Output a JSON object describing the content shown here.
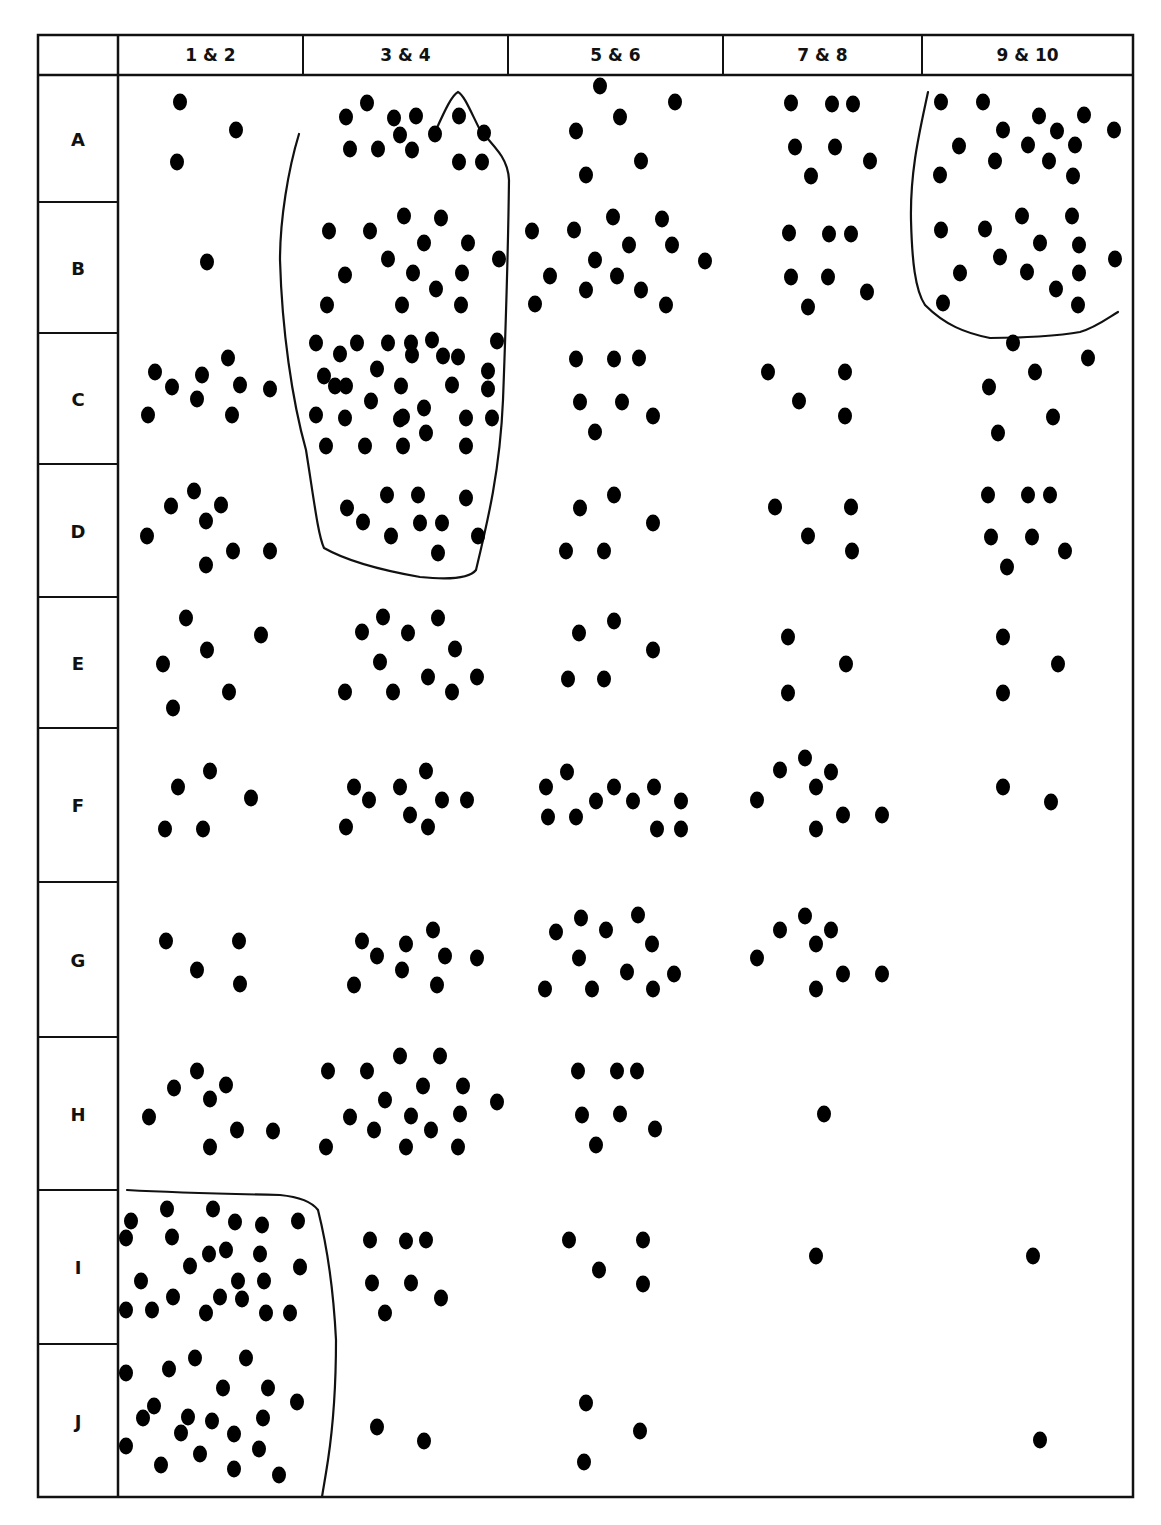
{
  "table": {
    "frame": {
      "left": 38,
      "top": 35,
      "right": 1133,
      "bottom": 1497,
      "header_bottom": 75,
      "label_col_right": 118
    },
    "line_color": "#111111",
    "dot_color": "#000000",
    "columns": [
      {
        "label": "1 & 2",
        "x0": 118,
        "x1": 303
      },
      {
        "label": "3 & 4",
        "x0": 303,
        "x1": 508
      },
      {
        "label": "5 & 6",
        "x0": 508,
        "x1": 723
      },
      {
        "label": "7 & 8",
        "x0": 723,
        "x1": 922
      },
      {
        "label": "9 & 10",
        "x0": 922,
        "x1": 1133
      }
    ],
    "rows": [
      {
        "label": "A",
        "y0": 75,
        "y1": 202
      },
      {
        "label": "B",
        "y0": 202,
        "y1": 333
      },
      {
        "label": "C",
        "y0": 333,
        "y1": 464
      },
      {
        "label": "D",
        "y0": 464,
        "y1": 597
      },
      {
        "label": "E",
        "y0": 597,
        "y1": 728
      },
      {
        "label": "F",
        "y0": 728,
        "y1": 882
      },
      {
        "label": "G",
        "y0": 882,
        "y1": 1037
      },
      {
        "label": "H",
        "y0": 1037,
        "y1": 1190
      },
      {
        "label": "I",
        "y0": 1190,
        "y1": 1344
      },
      {
        "label": "J",
        "y0": 1344,
        "y1": 1497
      }
    ]
  },
  "boundaries": [
    {
      "name": "cluster-3-4-A-D",
      "path": "M299,134 C288,170 280,220 280,260 C282,330 292,400 306,450 C314,500 318,535 324,548 C345,560 380,570 420,577 C450,580 470,578 476,570 C488,520 500,470 503,400 C506,320 508,260 509,180 C508,160 498,150 480,130 C470,110 464,95 458,92 C452,95 445,110 436,130"
    },
    {
      "name": "cluster-9-10-A-B",
      "path": "M928,92 C920,130 910,170 911,220 C912,260 915,290 925,305 C945,325 965,333 990,338 C1020,338 1060,336 1080,332 C1095,328 1108,318 1118,312"
    },
    {
      "name": "cluster-1-2-I-J",
      "path": "M127,1190 C180,1193 230,1194 280,1195 C300,1197 312,1202 318,1210 C328,1250 334,1300 336,1340 C336,1380 334,1420 328,1460 C325,1480 323,1490 322,1497"
    }
  ],
  "dots": [
    [
      180,
      102
    ],
    [
      236,
      130
    ],
    [
      177,
      162
    ],
    [
      367,
      103
    ],
    [
      346,
      117
    ],
    [
      394,
      118
    ],
    [
      416,
      116
    ],
    [
      459,
      116
    ],
    [
      484,
      133
    ],
    [
      435,
      134
    ],
    [
      350,
      149
    ],
    [
      378,
      149
    ],
    [
      400,
      135
    ],
    [
      412,
      150
    ],
    [
      459,
      162
    ],
    [
      482,
      162
    ],
    [
      600,
      86
    ],
    [
      675,
      102
    ],
    [
      620,
      117
    ],
    [
      576,
      131
    ],
    [
      641,
      161
    ],
    [
      586,
      175
    ],
    [
      791,
      103
    ],
    [
      832,
      104
    ],
    [
      853,
      104
    ],
    [
      795,
      147
    ],
    [
      835,
      147
    ],
    [
      870,
      161
    ],
    [
      811,
      176
    ],
    [
      941,
      102
    ],
    [
      983,
      102
    ],
    [
      1039,
      116
    ],
    [
      1084,
      115
    ],
    [
      1114,
      130
    ],
    [
      1003,
      130
    ],
    [
      1057,
      131
    ],
    [
      959,
      146
    ],
    [
      995,
      161
    ],
    [
      1028,
      145
    ],
    [
      1075,
      145
    ],
    [
      1049,
      161
    ],
    [
      940,
      175
    ],
    [
      1073,
      176
    ],
    [
      207,
      262
    ],
    [
      329,
      231
    ],
    [
      370,
      231
    ],
    [
      404,
      216
    ],
    [
      441,
      218
    ],
    [
      424,
      243
    ],
    [
      468,
      243
    ],
    [
      499,
      259
    ],
    [
      345,
      275
    ],
    [
      388,
      259
    ],
    [
      413,
      273
    ],
    [
      436,
      289
    ],
    [
      462,
      273
    ],
    [
      327,
      305
    ],
    [
      402,
      305
    ],
    [
      461,
      305
    ],
    [
      532,
      231
    ],
    [
      574,
      230
    ],
    [
      613,
      217
    ],
    [
      662,
      219
    ],
    [
      629,
      245
    ],
    [
      672,
      245
    ],
    [
      705,
      261
    ],
    [
      550,
      276
    ],
    [
      595,
      260
    ],
    [
      617,
      276
    ],
    [
      641,
      290
    ],
    [
      666,
      305
    ],
    [
      535,
      304
    ],
    [
      586,
      290
    ],
    [
      789,
      233
    ],
    [
      829,
      234
    ],
    [
      851,
      234
    ],
    [
      791,
      277
    ],
    [
      828,
      277
    ],
    [
      867,
      292
    ],
    [
      808,
      307
    ],
    [
      941,
      230
    ],
    [
      985,
      229
    ],
    [
      1022,
      216
    ],
    [
      1072,
      216
    ],
    [
      1040,
      243
    ],
    [
      1079,
      245
    ],
    [
      1115,
      259
    ],
    [
      960,
      273
    ],
    [
      1000,
      257
    ],
    [
      1027,
      272
    ],
    [
      1056,
      289
    ],
    [
      1079,
      273
    ],
    [
      943,
      303
    ],
    [
      1078,
      305
    ],
    [
      155,
      372
    ],
    [
      172,
      387
    ],
    [
      202,
      375
    ],
    [
      228,
      358
    ],
    [
      240,
      385
    ],
    [
      270,
      389
    ],
    [
      148,
      415
    ],
    [
      197,
      399
    ],
    [
      232,
      415
    ],
    [
      316,
      343
    ],
    [
      340,
      354
    ],
    [
      357,
      343
    ],
    [
      388,
      343
    ],
    [
      411,
      343
    ],
    [
      432,
      340
    ],
    [
      458,
      357
    ],
    [
      497,
      341
    ],
    [
      324,
      376
    ],
    [
      346,
      386
    ],
    [
      377,
      369
    ],
    [
      412,
      355
    ],
    [
      443,
      356
    ],
    [
      488,
      371
    ],
    [
      335,
      386
    ],
    [
      401,
      386
    ],
    [
      452,
      385
    ],
    [
      488,
      389
    ],
    [
      316,
      415
    ],
    [
      345,
      418
    ],
    [
      371,
      401
    ],
    [
      400,
      419
    ],
    [
      424,
      408
    ],
    [
      403,
      417
    ],
    [
      466,
      418
    ],
    [
      492,
      418
    ],
    [
      326,
      446
    ],
    [
      365,
      446
    ],
    [
      403,
      446
    ],
    [
      426,
      433
    ],
    [
      466,
      446
    ],
    [
      576,
      359
    ],
    [
      614,
      359
    ],
    [
      639,
      358
    ],
    [
      580,
      402
    ],
    [
      622,
      402
    ],
    [
      653,
      416
    ],
    [
      595,
      432
    ],
    [
      768,
      372
    ],
    [
      845,
      372
    ],
    [
      799,
      401
    ],
    [
      845,
      416
    ],
    [
      1013,
      343
    ],
    [
      1088,
      358
    ],
    [
      1035,
      372
    ],
    [
      989,
      387
    ],
    [
      1053,
      417
    ],
    [
      998,
      433
    ],
    [
      171,
      506
    ],
    [
      194,
      491
    ],
    [
      206,
      521
    ],
    [
      221,
      505
    ],
    [
      147,
      536
    ],
    [
      233,
      551
    ],
    [
      270,
      551
    ],
    [
      206,
      565
    ],
    [
      347,
      508
    ],
    [
      387,
      495
    ],
    [
      418,
      495
    ],
    [
      466,
      498
    ],
    [
      363,
      522
    ],
    [
      420,
      523
    ],
    [
      442,
      523
    ],
    [
      391,
      536
    ],
    [
      478,
      536
    ],
    [
      438,
      553
    ],
    [
      580,
      508
    ],
    [
      614,
      495
    ],
    [
      653,
      523
    ],
    [
      566,
      551
    ],
    [
      604,
      551
    ],
    [
      775,
      507
    ],
    [
      851,
      507
    ],
    [
      808,
      536
    ],
    [
      852,
      551
    ],
    [
      988,
      495
    ],
    [
      1028,
      495
    ],
    [
      1050,
      495
    ],
    [
      991,
      537
    ],
    [
      1032,
      537
    ],
    [
      1065,
      551
    ],
    [
      1007,
      567
    ],
    [
      186,
      618
    ],
    [
      261,
      635
    ],
    [
      207,
      650
    ],
    [
      163,
      664
    ],
    [
      229,
      692
    ],
    [
      173,
      708
    ],
    [
      362,
      632
    ],
    [
      383,
      617
    ],
    [
      408,
      633
    ],
    [
      438,
      618
    ],
    [
      455,
      649
    ],
    [
      380,
      662
    ],
    [
      345,
      692
    ],
    [
      393,
      692
    ],
    [
      428,
      677
    ],
    [
      452,
      692
    ],
    [
      477,
      677
    ],
    [
      579,
      633
    ],
    [
      614,
      621
    ],
    [
      653,
      650
    ],
    [
      568,
      679
    ],
    [
      604,
      679
    ],
    [
      788,
      637
    ],
    [
      846,
      664
    ],
    [
      788,
      693
    ],
    [
      1003,
      637
    ],
    [
      1058,
      664
    ],
    [
      1003,
      693
    ],
    [
      178,
      787
    ],
    [
      210,
      771
    ],
    [
      251,
      798
    ],
    [
      165,
      829
    ],
    [
      203,
      829
    ],
    [
      354,
      787
    ],
    [
      369,
      800
    ],
    [
      400,
      787
    ],
    [
      426,
      771
    ],
    [
      442,
      800
    ],
    [
      410,
      815
    ],
    [
      467,
      800
    ],
    [
      346,
      827
    ],
    [
      428,
      827
    ],
    [
      546,
      787
    ],
    [
      567,
      772
    ],
    [
      548,
      817
    ],
    [
      576,
      817
    ],
    [
      596,
      801
    ],
    [
      614,
      787
    ],
    [
      633,
      801
    ],
    [
      654,
      787
    ],
    [
      657,
      829
    ],
    [
      681,
      829
    ],
    [
      681,
      801
    ],
    [
      780,
      770
    ],
    [
      805,
      758
    ],
    [
      831,
      772
    ],
    [
      816,
      787
    ],
    [
      757,
      800
    ],
    [
      843,
      815
    ],
    [
      882,
      815
    ],
    [
      816,
      829
    ],
    [
      1003,
      787
    ],
    [
      1051,
      802
    ],
    [
      166,
      941
    ],
    [
      239,
      941
    ],
    [
      197,
      970
    ],
    [
      240,
      984
    ],
    [
      362,
      941
    ],
    [
      377,
      956
    ],
    [
      406,
      944
    ],
    [
      433,
      930
    ],
    [
      445,
      956
    ],
    [
      402,
      970
    ],
    [
      354,
      985
    ],
    [
      437,
      985
    ],
    [
      477,
      958
    ],
    [
      556,
      932
    ],
    [
      581,
      918
    ],
    [
      606,
      930
    ],
    [
      638,
      915
    ],
    [
      652,
      944
    ],
    [
      579,
      958
    ],
    [
      627,
      972
    ],
    [
      545,
      989
    ],
    [
      592,
      989
    ],
    [
      653,
      989
    ],
    [
      674,
      974
    ],
    [
      780,
      930
    ],
    [
      805,
      916
    ],
    [
      831,
      930
    ],
    [
      816,
      944
    ],
    [
      757,
      958
    ],
    [
      843,
      974
    ],
    [
      882,
      974
    ],
    [
      816,
      989
    ],
    [
      174,
      1088
    ],
    [
      197,
      1071
    ],
    [
      226,
      1085
    ],
    [
      210,
      1099
    ],
    [
      149,
      1117
    ],
    [
      237,
      1130
    ],
    [
      273,
      1131
    ],
    [
      210,
      1147
    ],
    [
      328,
      1071
    ],
    [
      367,
      1071
    ],
    [
      400,
      1056
    ],
    [
      440,
      1056
    ],
    [
      423,
      1086
    ],
    [
      463,
      1086
    ],
    [
      350,
      1117
    ],
    [
      385,
      1100
    ],
    [
      411,
      1116
    ],
    [
      460,
      1114
    ],
    [
      497,
      1102
    ],
    [
      326,
      1147
    ],
    [
      374,
      1130
    ],
    [
      406,
      1147
    ],
    [
      431,
      1130
    ],
    [
      458,
      1147
    ],
    [
      578,
      1071
    ],
    [
      617,
      1071
    ],
    [
      637,
      1071
    ],
    [
      582,
      1115
    ],
    [
      620,
      1114
    ],
    [
      655,
      1129
    ],
    [
      596,
      1145
    ],
    [
      824,
      1114
    ],
    [
      167,
      1209
    ],
    [
      213,
      1209
    ],
    [
      131,
      1221
    ],
    [
      126,
      1238
    ],
    [
      235,
      1222
    ],
    [
      172,
      1237
    ],
    [
      262,
      1225
    ],
    [
      298,
      1221
    ],
    [
      209,
      1254
    ],
    [
      260,
      1254
    ],
    [
      226,
      1250
    ],
    [
      300,
      1267
    ],
    [
      141,
      1281
    ],
    [
      190,
      1266
    ],
    [
      238,
      1281
    ],
    [
      264,
      1281
    ],
    [
      173,
      1297
    ],
    [
      220,
      1297
    ],
    [
      126,
      1310
    ],
    [
      152,
      1310
    ],
    [
      206,
      1313
    ],
    [
      242,
      1299
    ],
    [
      266,
      1313
    ],
    [
      290,
      1313
    ],
    [
      370,
      1240
    ],
    [
      406,
      1241
    ],
    [
      426,
      1240
    ],
    [
      372,
      1283
    ],
    [
      411,
      1283
    ],
    [
      441,
      1298
    ],
    [
      385,
      1313
    ],
    [
      569,
      1240
    ],
    [
      643,
      1240
    ],
    [
      599,
      1270
    ],
    [
      643,
      1284
    ],
    [
      816,
      1256
    ],
    [
      1033,
      1256
    ],
    [
      126,
      1373
    ],
    [
      169,
      1369
    ],
    [
      195,
      1358
    ],
    [
      246,
      1358
    ],
    [
      223,
      1388
    ],
    [
      268,
      1388
    ],
    [
      297,
      1402
    ],
    [
      154,
      1406
    ],
    [
      143,
      1418
    ],
    [
      188,
      1417
    ],
    [
      212,
      1421
    ],
    [
      263,
      1418
    ],
    [
      181,
      1433
    ],
    [
      234,
      1434
    ],
    [
      259,
      1449
    ],
    [
      126,
      1446
    ],
    [
      200,
      1454
    ],
    [
      161,
      1465
    ],
    [
      234,
      1469
    ],
    [
      279,
      1475
    ],
    [
      377,
      1427
    ],
    [
      424,
      1441
    ],
    [
      586,
      1403
    ],
    [
      640,
      1431
    ],
    [
      584,
      1462
    ],
    [
      1040,
      1440
    ]
  ]
}
